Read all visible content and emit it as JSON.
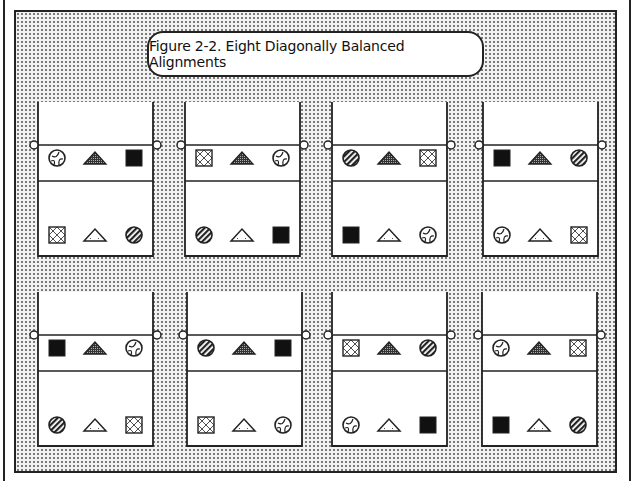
{
  "title": "Figure 2-2. Eight Diagonally Balanced Alignments",
  "symbol_legend": {
    "wheel": "circle with curved segments (outline)",
    "tri_dark": "stippled dark triangle",
    "square_black": "solid black square",
    "square_x": "square with crossed diagonal lattice",
    "tri_light": "light outlined triangle",
    "circle_stripe": "diagonally striped circle"
  },
  "panels": [
    {
      "label": "Alignment 1",
      "top_row": [
        "wheel",
        "tri_dark",
        "square_black"
      ],
      "bottom_row": [
        "square_x",
        "tri_light",
        "circle_stripe"
      ]
    },
    {
      "label": "Alignment 2",
      "top_row": [
        "square_x",
        "tri_dark",
        "wheel"
      ],
      "bottom_row": [
        "circle_stripe",
        "tri_light",
        "square_black"
      ]
    },
    {
      "label": "Alignment 3",
      "top_row": [
        "circle_stripe",
        "tri_dark",
        "square_x"
      ],
      "bottom_row": [
        "square_black",
        "tri_light",
        "wheel"
      ]
    },
    {
      "label": "Alignment 4",
      "top_row": [
        "square_black",
        "tri_dark",
        "circle_stripe"
      ],
      "bottom_row": [
        "wheel",
        "tri_light",
        "square_x"
      ]
    },
    {
      "label": "Alignment 5",
      "top_row": [
        "square_black",
        "tri_dark",
        "wheel"
      ],
      "bottom_row": [
        "circle_stripe",
        "tri_light",
        "square_x"
      ]
    },
    {
      "label": "Alignment 6",
      "top_row": [
        "circle_stripe",
        "tri_dark",
        "square_black"
      ],
      "bottom_row": [
        "square_x",
        "tri_light",
        "wheel"
      ]
    },
    {
      "label": "Alignment 7",
      "top_row": [
        "square_x",
        "tri_dark",
        "circle_stripe"
      ],
      "bottom_row": [
        "wheel",
        "tri_light",
        "square_black"
      ]
    },
    {
      "label": "Alignment 8",
      "top_row": [
        "wheel",
        "tri_dark",
        "square_x"
      ],
      "bottom_row": [
        "square_black",
        "tri_light",
        "circle_stripe"
      ]
    }
  ],
  "colors": {
    "ink": "#222222",
    "black_fill": "#111111",
    "dark_triangle": "#6e6e6e",
    "paper": "#ffffff"
  }
}
